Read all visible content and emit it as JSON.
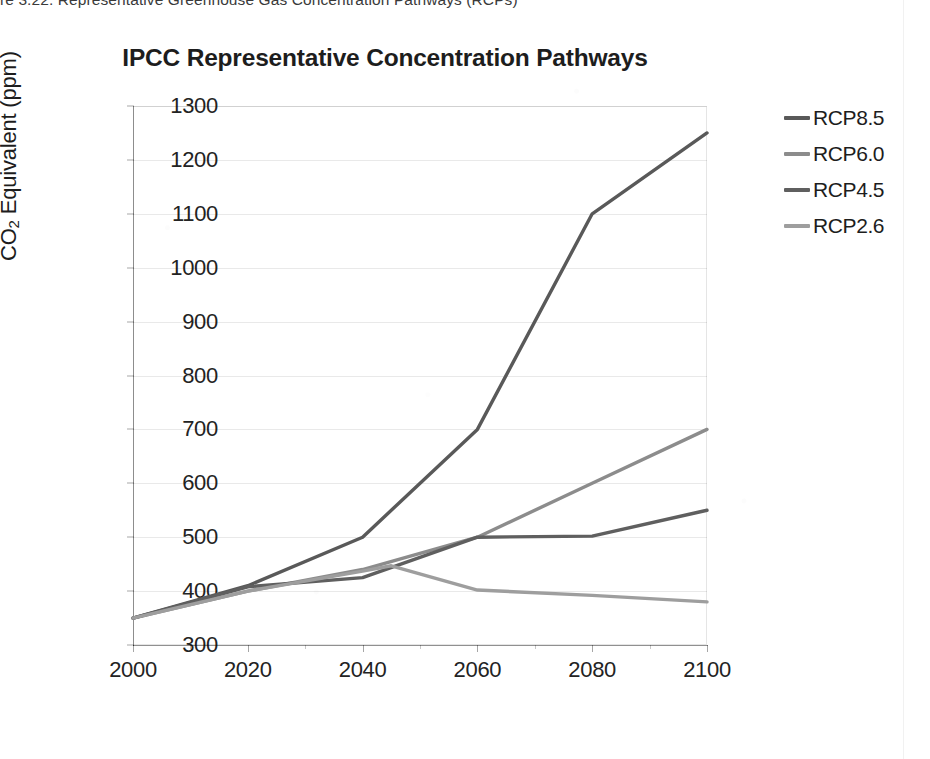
{
  "page": {
    "header_text": "re 3.22. Representative Greenhouse Gas Concentration Pathways (RCPs)"
  },
  "chart_data": {
    "type": "line",
    "title": "IPCC Representative Concentration Pathways",
    "xlabel": "",
    "ylabel": "CO2 Equivalent (ppm)",
    "ylabel_prefix": "CO",
    "ylabel_sub": "2",
    "ylabel_suffix": " Equivalent (ppm)",
    "x": [
      2000,
      2020,
      2040,
      2045,
      2060,
      2080,
      2100
    ],
    "xlim": [
      2000,
      2100
    ],
    "ylim": [
      300,
      1300
    ],
    "xticks": [
      2000,
      2020,
      2040,
      2060,
      2080,
      2100
    ],
    "yticks": [
      300,
      400,
      500,
      600,
      700,
      800,
      900,
      1000,
      1100,
      1200,
      1300
    ],
    "grid": true,
    "legend_position": "right",
    "series": [
      {
        "name": "RCP8.5",
        "color": "#595959",
        "x": [
          2000,
          2020,
          2040,
          2060,
          2080,
          2100
        ],
        "values": [
          350,
          410,
          500,
          700,
          1100,
          1250
        ]
      },
      {
        "name": "RCP6.0",
        "color": "#8c8c8c",
        "x": [
          2000,
          2020,
          2040,
          2060,
          2080,
          2100
        ],
        "values": [
          350,
          400,
          440,
          500,
          600,
          700
        ]
      },
      {
        "name": "RCP4.5",
        "color": "#5f5f5f",
        "x": [
          2000,
          2020,
          2040,
          2060,
          2080,
          2100
        ],
        "values": [
          350,
          408,
          425,
          500,
          502,
          550
        ]
      },
      {
        "name": "RCP2.6",
        "color": "#9e9e9e",
        "x": [
          2000,
          2020,
          2040,
          2045,
          2060,
          2080,
          2100
        ],
        "values": [
          350,
          400,
          437,
          447,
          402,
          392,
          380
        ]
      }
    ]
  },
  "legend": {
    "items": [
      {
        "label": "RCP8.5",
        "color": "#595959"
      },
      {
        "label": "RCP6.0",
        "color": "#8c8c8c"
      },
      {
        "label": "RCP4.5",
        "color": "#5f5f5f"
      },
      {
        "label": "RCP2.6",
        "color": "#9e9e9e"
      }
    ]
  }
}
